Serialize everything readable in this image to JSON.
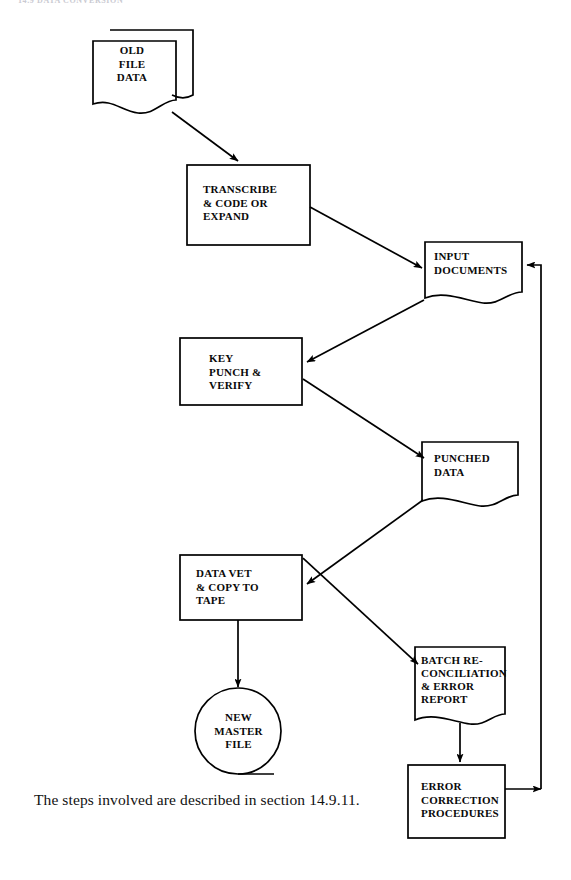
{
  "page": {
    "header_partial_text": "14.9  DATA CONVERSION",
    "caption": "The steps involved are described in section 14.9.11.",
    "ink_color": "#000000",
    "background_color": "#ffffff"
  },
  "diagram": {
    "type": "flowchart",
    "nodes": [
      {
        "id": "old-file-data",
        "label": "OLD\nFILE\nDATA",
        "shape": "stacked-document",
        "x": 93,
        "y": 25,
        "w": 100,
        "h": 85
      },
      {
        "id": "transcribe",
        "label": "TRANSCRIBE\n& CODE OR\nEXPAND",
        "shape": "process-rectangle",
        "x": 187,
        "y": 165,
        "w": 123,
        "h": 80
      },
      {
        "id": "input-documents",
        "label": "INPUT\nDOCUMENTS",
        "shape": "document",
        "x": 425,
        "y": 240,
        "w": 97,
        "h": 62
      },
      {
        "id": "key-punch-verify",
        "label": "KEY\nPUNCH &\nVERIFY",
        "shape": "process-rectangle",
        "x": 180,
        "y": 338,
        "w": 122,
        "h": 67
      },
      {
        "id": "punched-data",
        "label": "PUNCHED\nDATA",
        "shape": "document",
        "x": 422,
        "y": 440,
        "w": 96,
        "h": 66
      },
      {
        "id": "data-vet-copy-tape",
        "label": "DATA VET\n& COPY TO\nTAPE",
        "shape": "process-rectangle",
        "x": 180,
        "y": 555,
        "w": 122,
        "h": 65
      },
      {
        "id": "batch-reconciliation",
        "label": "BATCH RE-\nCONCILIATION\n& ERROR\nREPORT",
        "shape": "document",
        "x": 415,
        "y": 645,
        "w": 90,
        "h": 77
      },
      {
        "id": "new-master-file",
        "label": "NEW\nMASTER\nFILE",
        "shape": "magnetic-tape",
        "x": 193,
        "y": 690,
        "w": 90,
        "h": 82
      },
      {
        "id": "error-correction",
        "label": "ERROR\nCORRECTION\nPROCEDURES",
        "shape": "process-rectangle",
        "x": 408,
        "y": 765,
        "w": 97,
        "h": 73
      }
    ],
    "connections": [
      {
        "from": "old-file-data",
        "to": "transcribe",
        "style": "diagonal-arrow"
      },
      {
        "from": "transcribe",
        "to": "input-documents",
        "style": "diagonal-arrow"
      },
      {
        "from": "input-documents",
        "to": "key-punch-verify",
        "style": "diagonal-arrow"
      },
      {
        "from": "key-punch-verify",
        "to": "punched-data",
        "style": "diagonal-arrow"
      },
      {
        "from": "punched-data",
        "to": "data-vet-copy-tape",
        "style": "diagonal-arrow"
      },
      {
        "from": "data-vet-copy-tape",
        "to": "new-master-file",
        "style": "vertical-arrow"
      },
      {
        "from": "data-vet-copy-tape",
        "to": "batch-reconciliation",
        "style": "diagonal-arrow"
      },
      {
        "from": "batch-reconciliation",
        "to": "error-correction",
        "style": "vertical-arrow"
      },
      {
        "from": "error-correction",
        "to": "input-documents",
        "style": "feedback-loop-right"
      }
    ]
  }
}
